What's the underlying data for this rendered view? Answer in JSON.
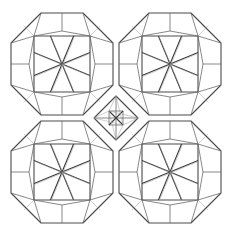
{
  "figure": {
    "width": 231,
    "height": 235,
    "background": "#ffffff",
    "stroke_color": "#4a4a4a",
    "rosettes": [
      {
        "name": "top-left",
        "cx": 62,
        "cy": 64
      },
      {
        "name": "top-right",
        "cx": 170,
        "cy": 64
      },
      {
        "name": "bottom-left",
        "cx": 62,
        "cy": 172
      },
      {
        "name": "bottom-right",
        "cx": 170,
        "cy": 172
      }
    ],
    "center_motif": {
      "cx": 116,
      "cy": 118,
      "size": 22
    }
  }
}
